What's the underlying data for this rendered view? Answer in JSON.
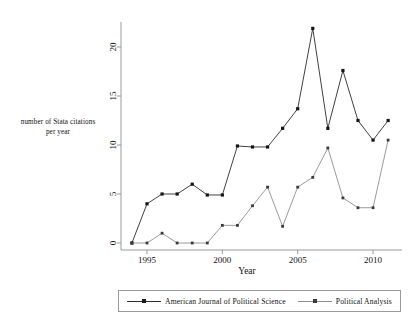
{
  "chart_data": {
    "type": "line",
    "title": "",
    "xlabel": "Year",
    "ylabel": "number of Stata citations per year",
    "ylabel_line1": "number of Stata citations",
    "ylabel_line2": "per year",
    "x": [
      1994,
      1995,
      1996,
      1997,
      1998,
      1999,
      2000,
      2001,
      2002,
      2003,
      2004,
      2005,
      2006,
      2007,
      2008,
      2009,
      2010,
      2011
    ],
    "xlim": [
      1993.6,
      2011.6
    ],
    "ylim": [
      0,
      22.5
    ],
    "xticks": [
      1995,
      2000,
      2005,
      2010
    ],
    "xtick_labels": [
      "1995",
      "2000",
      "2005",
      "2010"
    ],
    "yticks": [
      0,
      5,
      10,
      15,
      20
    ],
    "ytick_labels": [
      "0",
      "5",
      "10",
      "15",
      "20"
    ],
    "grid": false,
    "legend_position": "bottom",
    "series": [
      {
        "name": "American Journal of Political Science",
        "color": "#2b2b2b",
        "marker": "square",
        "values": [
          0,
          4,
          5,
          5,
          6,
          4.9,
          4.9,
          9.9,
          9.8,
          9.8,
          11.7,
          13.7,
          21.9,
          11.7,
          17.6,
          12.5,
          10.5,
          12.5
        ]
      },
      {
        "name": "Political Analysis",
        "color": "#8e8e8e",
        "marker": "square",
        "values": [
          0,
          0,
          1,
          0,
          0,
          0,
          1.8,
          1.8,
          3.8,
          5.7,
          1.7,
          5.7,
          6.7,
          9.7,
          4.6,
          3.6,
          3.6,
          10.5
        ]
      }
    ]
  },
  "axes": {
    "x_axis_label": "Year",
    "y_axis_label_line1": "number of Stata citations",
    "y_axis_label_line2": "per year"
  },
  "legend": {
    "entries": [
      {
        "label": "American Journal of Political Science"
      },
      {
        "label": "Political Analysis"
      }
    ]
  }
}
